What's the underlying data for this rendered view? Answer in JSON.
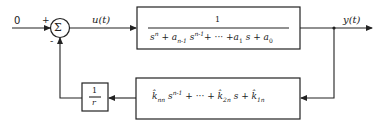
{
  "diagram": {
    "type": "feedback-control-block-diagram",
    "input": {
      "label": "0"
    },
    "summing_junction": {
      "symbol": "Σ",
      "plus_sign": "+",
      "minus_sign": "-"
    },
    "control_signal": {
      "label": "u(t)"
    },
    "plant": {
      "numerator": "1",
      "denominator": "s^n + a_{n-1} s^{n-1} + ··· + a_1 s + a_0",
      "den_parts": {
        "s": "s",
        "n": "n",
        "plus": "+",
        "a": "a",
        "nm1": "n-1",
        "dots": "···",
        "one": "1",
        "zero": "0"
      }
    },
    "output": {
      "label": "y(t)"
    },
    "feedback_filter": {
      "expression": "k̂_nn s^{n-1} + ··· + k̂_2n s + k̂_1n",
      "parts": {
        "k": "k̂",
        "nn": "nn",
        "s": "s",
        "nm1": "n-1",
        "plus": "+",
        "dots": "···",
        "twon": "2n",
        "onen": "1n"
      }
    },
    "gain": {
      "numerator": "1",
      "denominator": "r"
    },
    "colors": {
      "line": "#222222",
      "background": "#ffffff"
    }
  }
}
